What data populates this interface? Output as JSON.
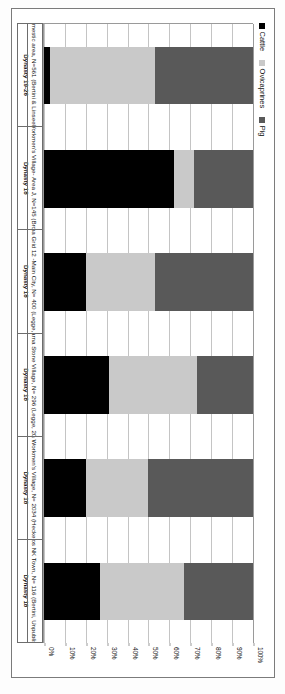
{
  "figure": {
    "orientation": "page-rotated-90",
    "background": "#ffffff",
    "frame_color": "#7b7b7b"
  },
  "legend": {
    "position": "top-left",
    "items": [
      {
        "label": "Cattle",
        "color": "#000000",
        "icon": "square-swatch-icon"
      },
      {
        "label": "Ovicaprines",
        "color": "#c9c9c9",
        "icon": "square-swatch-icon"
      },
      {
        "label": "Pig",
        "color": "#595959",
        "icon": "square-swatch-icon"
      }
    ]
  },
  "axis": {
    "ticks": [
      "0%",
      "10%",
      "20%",
      "30%",
      "40%",
      "50%",
      "60%",
      "70%",
      "80%",
      "90%",
      "100%"
    ],
    "min": 0,
    "max": 100
  },
  "categories": [
    {
      "site": "Sais Domestic area, N=561 (Bertini & Linseele, 2011)",
      "dynasty": "Dynasty 19-26"
    },
    {
      "site": "Malkata Workmen's Village- Area J, N=145 (Brown, 1995)",
      "dynasty": "Dynasty 18"
    },
    {
      "site": "Amarna Grid 12 -Main City, N= 400 (Legge, 2010)",
      "dynasty": "Dynasty 18"
    },
    {
      "site": "Amarna Stone Village, N= 296 (Legge, 2012)",
      "dynasty": "Dynasty 18"
    },
    {
      "site": "Amarna Workmen's Village, N= 2034 (Hecker, 1984)",
      "dynasty": "Dynasty 18"
    },
    {
      "site": "Abydos NK Town, N= 116 (Bertini, Unpublished)",
      "dynasty": "Dynasty 18"
    }
  ],
  "chart_data": {
    "type": "bar",
    "subtype": "stacked-100-percent",
    "title": "",
    "xlabel": "",
    "ylabel": "",
    "ylim": [
      0,
      100
    ],
    "grid": true,
    "legend_position": "top-left",
    "categories": [
      "Sais Domestic area, N=561 (Bertini & Linseele, 2011)",
      "Malkata Workmen's Village- Area J, N=145 (Brown, 1995)",
      "Amarna Grid 12 -Main City, N= 400 (Legge, 2010)",
      "Amarna Stone Village, N= 296 (Legge, 2012)",
      "Amarna Workmen's Village, N= 2034 (Hecker, 1984)",
      "Abydos NK Town, N= 116 (Bertini, Unpublished)"
    ],
    "tick_labels": [
      "0%",
      "10%",
      "20%",
      "30%",
      "40%",
      "50%",
      "60%",
      "70%",
      "80%",
      "90%",
      "100%"
    ],
    "series": [
      {
        "name": "Cattle",
        "color": "#000000",
        "values": [
          3,
          62,
          20,
          31,
          20,
          27
        ]
      },
      {
        "name": "Ovicaprines",
        "color": "#c9c9c9",
        "values": [
          50,
          10,
          33,
          42,
          30,
          40
        ]
      },
      {
        "name": "Pig",
        "color": "#595959",
        "values": [
          47,
          28,
          47,
          27,
          50,
          33
        ]
      }
    ]
  }
}
